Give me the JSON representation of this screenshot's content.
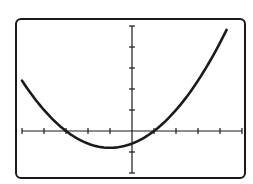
{
  "chart_data": {
    "type": "line",
    "title": "",
    "xlabel": "",
    "ylabel": "",
    "equation": "y = 0.2(x + 3)(x - 1)",
    "xlim": [
      -5,
      5
    ],
    "ylim": [
      -2,
      5
    ],
    "x_tick_step": 1,
    "y_tick_step": 1,
    "grid": false,
    "legend": null,
    "key_points": {
      "x_intercepts": [
        -3,
        1
      ],
      "y_intercept": -0.6,
      "vertex": [
        -1,
        -0.8
      ]
    },
    "series": [
      {
        "name": "parabola",
        "x": [
          -5,
          -4.5,
          -4,
          -3.5,
          -3,
          -2.5,
          -2,
          -1.5,
          -1,
          -0.5,
          0,
          0.5,
          1,
          1.5,
          2,
          2.5,
          3,
          3.5,
          4,
          4.3
        ],
        "y": [
          2.4,
          1.65,
          1.0,
          0.45,
          0.0,
          -0.35,
          -0.6,
          -0.75,
          -0.8,
          -0.75,
          -0.6,
          -0.35,
          0.0,
          0.45,
          1.0,
          1.65,
          2.4,
          3.25,
          4.2,
          4.82
        ]
      }
    ]
  },
  "colors": {
    "stroke": "#1a1a1a",
    "background": "#ffffff"
  }
}
